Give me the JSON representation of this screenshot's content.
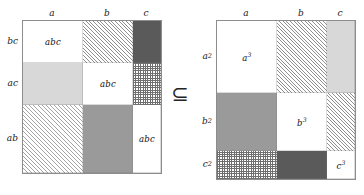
{
  "figure": {
    "relation_symbol": "⊆",
    "relation_name": "subset-or-equal"
  },
  "left_matrix": {
    "name": "left-matrix",
    "column_headers": [
      "a",
      "b",
      "c"
    ],
    "row_labels": [
      "bc",
      "ac",
      "ab"
    ],
    "cells": [
      [
        {
          "label": "abc",
          "fill": "white"
        },
        {
          "label": "",
          "fill": "hatch"
        },
        {
          "label": "",
          "fill": "dark"
        }
      ],
      [
        {
          "label": "",
          "fill": "light"
        },
        {
          "label": "abc",
          "fill": "white"
        },
        {
          "label": "",
          "fill": "check"
        }
      ],
      [
        {
          "label": "",
          "fill": "hatch-light"
        },
        {
          "label": "",
          "fill": "mid"
        },
        {
          "label": "abc",
          "fill": "white"
        }
      ]
    ]
  },
  "right_matrix": {
    "name": "right-matrix",
    "column_headers": [
      "a",
      "b",
      "c"
    ],
    "row_labels": [
      "a²",
      "b²",
      "c²"
    ],
    "cells": [
      [
        {
          "label": "a³",
          "fill": "white"
        },
        {
          "label": "",
          "fill": "hatch"
        },
        {
          "label": "",
          "fill": "light"
        }
      ],
      [
        {
          "label": "",
          "fill": "mid"
        },
        {
          "label": "b³",
          "fill": "white"
        },
        {
          "label": "",
          "fill": "hatch"
        }
      ],
      [
        {
          "label": "",
          "fill": "check"
        },
        {
          "label": "",
          "fill": "dark"
        },
        {
          "label": "c³",
          "fill": "white"
        }
      ]
    ]
  },
  "colors": {
    "white": "#ffffff",
    "light_gray": "#d8d8d8",
    "mid_gray": "#9a9a9a",
    "dark_gray": "#5a5a5a",
    "hatch_line": "#8f8f8f",
    "border": "#8d8d8d",
    "text": "#1a1a1a"
  }
}
